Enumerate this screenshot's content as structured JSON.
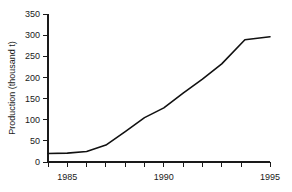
{
  "chart_data": {
    "type": "line",
    "title": "",
    "subtitle": "",
    "xlabel": "",
    "ylabel": "Production (thousand t)",
    "xlim": [
      1983.5,
      1995
    ],
    "ylim": [
      0,
      350
    ],
    "grid": false,
    "legend": null,
    "x_ticks": [
      1983.5,
      1984.5,
      1985.5,
      1986.5,
      1987.5,
      1988.5,
      1989.5,
      1990.5,
      1991.5,
      1992.5,
      1993.5,
      1995
    ],
    "x_tick_labels": [
      "",
      "1985",
      "",
      "",
      "",
      "",
      "1990",
      "",
      "",
      "",
      "",
      "1995"
    ],
    "x_labeled_ticks": [
      {
        "value": 1984.5,
        "label": "1985"
      },
      {
        "value": 1989.5,
        "label": "1990"
      },
      {
        "value": 1995,
        "label": "1995"
      }
    ],
    "y_ticks": [
      0,
      50,
      100,
      150,
      200,
      250,
      300,
      350
    ],
    "y_tick_labels": [
      "0",
      "50",
      "100",
      "150",
      "200",
      "250",
      "300",
      "350"
    ],
    "series": [
      {
        "name": "Production",
        "color": "#111111",
        "x": [
          1983.5,
          1984.5,
          1985.5,
          1986.5,
          1987.5,
          1988.5,
          1989.5,
          1990.5,
          1991.5,
          1992.5,
          1993.7,
          1995
        ],
        "values": [
          20,
          21,
          25,
          40,
          72,
          105,
          128,
          163,
          196,
          232,
          289,
          296
        ]
      }
    ],
    "annotations": []
  }
}
